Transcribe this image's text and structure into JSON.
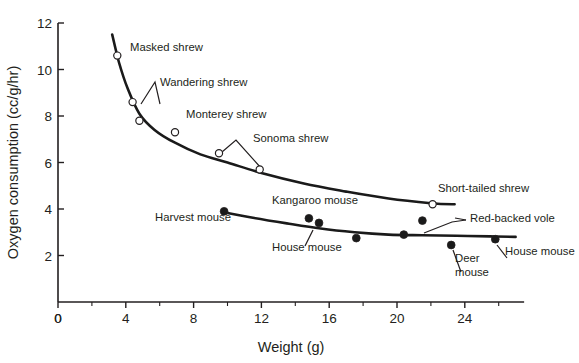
{
  "chart_data": {
    "type": "scatter",
    "title": "",
    "xlabel": "Weight (g)",
    "ylabel": "Oxygen consumption (cc/g/hr)",
    "xlim": [
      0,
      27.5
    ],
    "ylim": [
      0,
      12
    ],
    "xticks": [
      0,
      4,
      8,
      12,
      16,
      20,
      24
    ],
    "xticklabels": [
      "0",
      "4",
      "8",
      "12",
      "16",
      "20",
      "24"
    ],
    "x_minor_ticks": [
      2,
      6,
      10,
      14,
      18,
      22,
      26
    ],
    "yticks": [
      0,
      2,
      4,
      6,
      8,
      10,
      12
    ],
    "yticklabels": [
      "0",
      "2",
      "4",
      "6",
      "8",
      "10",
      "12"
    ],
    "grid": false,
    "legend": "none",
    "series": [
      {
        "name": "Shrews",
        "marker": "open-circle",
        "points": [
          {
            "label": "Masked shrew",
            "x": 3.5,
            "y": 10.6
          },
          {
            "label": "Wandering shrew",
            "x": 4.4,
            "y": 8.6
          },
          {
            "label": "Wandering shrew",
            "x": 4.8,
            "y": 7.8
          },
          {
            "label": "Monterey shrew",
            "x": 6.9,
            "y": 7.3
          },
          {
            "label": "Sonoma shrew",
            "x": 9.5,
            "y": 6.4
          },
          {
            "label": "Sonoma shrew",
            "x": 11.9,
            "y": 5.7
          },
          {
            "label": "Short-tailed shrew",
            "x": 22.1,
            "y": 4.2
          }
        ],
        "curve": [
          {
            "x": 3.2,
            "y": 11.5
          },
          {
            "x": 3.6,
            "y": 10.3
          },
          {
            "x": 4.1,
            "y": 9.2
          },
          {
            "x": 4.8,
            "y": 8.1
          },
          {
            "x": 5.7,
            "y": 7.4
          },
          {
            "x": 6.9,
            "y": 6.85
          },
          {
            "x": 8.4,
            "y": 6.35
          },
          {
            "x": 10.0,
            "y": 6.0
          },
          {
            "x": 12.0,
            "y": 5.55
          },
          {
            "x": 14.5,
            "y": 5.1
          },
          {
            "x": 17.0,
            "y": 4.75
          },
          {
            "x": 19.5,
            "y": 4.45
          },
          {
            "x": 22.0,
            "y": 4.25
          },
          {
            "x": 23.4,
            "y": 4.2
          }
        ]
      },
      {
        "name": "Mice and voles",
        "marker": "filled-circle",
        "points": [
          {
            "label": "Harvest mouse",
            "x": 9.8,
            "y": 3.9
          },
          {
            "label": "Kangaroo mouse",
            "x": 14.8,
            "y": 3.6
          },
          {
            "label": "Kangaroo mouse",
            "x": 15.4,
            "y": 3.4
          },
          {
            "label": "House mouse",
            "x": 17.6,
            "y": 2.75
          },
          {
            "label": "Red-backed vole",
            "x": 21.5,
            "y": 3.5
          },
          {
            "label": "Red-backed vole",
            "x": 20.4,
            "y": 2.9
          },
          {
            "label": "Deer mouse",
            "x": 23.2,
            "y": 2.45
          },
          {
            "label": "House mouse",
            "x": 25.8,
            "y": 2.7
          }
        ],
        "curve": [
          {
            "x": 9.7,
            "y": 3.87
          },
          {
            "x": 11.5,
            "y": 3.62
          },
          {
            "x": 13.5,
            "y": 3.38
          },
          {
            "x": 15.5,
            "y": 3.16
          },
          {
            "x": 17.5,
            "y": 3.0
          },
          {
            "x": 19.5,
            "y": 2.9
          },
          {
            "x": 21.5,
            "y": 2.87
          },
          {
            "x": 23.5,
            "y": 2.85
          },
          {
            "x": 25.5,
            "y": 2.82
          },
          {
            "x": 27.0,
            "y": 2.8
          }
        ]
      }
    ],
    "annotations": [
      {
        "text": "Masked shrew",
        "x": 130,
        "y": 51,
        "anchor": "start"
      },
      {
        "text": "Wandering shrew",
        "x": 160,
        "y": 86,
        "anchor": "start"
      },
      {
        "text": "Monterey shrew",
        "x": 186,
        "y": 118,
        "anchor": "start"
      },
      {
        "text": "Sonoma shrew",
        "x": 253,
        "y": 142,
        "anchor": "start"
      },
      {
        "text": "Short-tailed shrew",
        "x": 438,
        "y": 192,
        "anchor": "start"
      },
      {
        "text": "Harvest mouse",
        "x": 155,
        "y": 221,
        "anchor": "start"
      },
      {
        "text": "Kangaroo mouse",
        "x": 272,
        "y": 204,
        "anchor": "start"
      },
      {
        "text": "House mouse",
        "x": 272,
        "y": 251,
        "anchor": "start"
      },
      {
        "text": "Red-backed vole",
        "x": 470,
        "y": 222,
        "anchor": "start"
      },
      {
        "text": "Deer",
        "x": 455,
        "y": 262,
        "anchor": "start"
      },
      {
        "text": "mouse",
        "x": 455,
        "y": 276,
        "anchor": "start"
      },
      {
        "text": "House mouse",
        "x": 505,
        "y": 255,
        "anchor": "start"
      }
    ],
    "colors": {
      "ink": "#231f20",
      "curve": "#1a1a1a",
      "marker_fill": "#1a1a1a",
      "background": "#ffffff"
    }
  }
}
